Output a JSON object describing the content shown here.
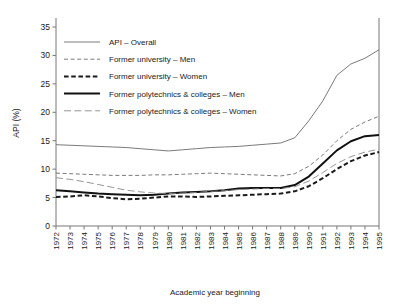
{
  "chart_data": {
    "type": "line",
    "title": "",
    "xlabel": "Academic year beginning",
    "ylabel": "API (%)",
    "xlim": [
      1972,
      1995
    ],
    "ylim": [
      0,
      35
    ],
    "ytick_values": [
      0,
      5,
      10,
      15,
      20,
      25,
      30,
      35
    ],
    "grid": false,
    "legend_position": "top-left-inside",
    "x": [
      1972,
      1973,
      1974,
      1975,
      1976,
      1977,
      1978,
      1979,
      1980,
      1981,
      1982,
      1983,
      1984,
      1985,
      1986,
      1987,
      1988,
      1989,
      1990,
      1991,
      1992,
      1993,
      1994,
      1995
    ],
    "series": [
      {
        "name": "API – Overall",
        "style": "solid-thin",
        "color": "#6b6b6b",
        "values": [
          14.3,
          14.2,
          14.1,
          14.0,
          13.9,
          13.8,
          13.6,
          13.4,
          13.2,
          13.4,
          13.6,
          13.8,
          13.9,
          14.0,
          14.2,
          14.4,
          14.6,
          15.5,
          18.5,
          22.0,
          26.5,
          28.5,
          29.5,
          31.0
        ]
      },
      {
        "name": "Former university – Men",
        "style": "dashed-thin",
        "color": "#6b6b6b",
        "values": [
          9.3,
          9.2,
          9.1,
          9.0,
          8.9,
          8.9,
          8.9,
          9.0,
          9.0,
          9.1,
          9.2,
          9.3,
          9.2,
          9.1,
          9.0,
          8.9,
          8.8,
          9.2,
          10.5,
          12.5,
          15.0,
          17.0,
          18.3,
          19.3
        ]
      },
      {
        "name": "Former university – Women",
        "style": "dashed-bold",
        "color": "#1a1a1a",
        "values": [
          5.1,
          5.2,
          5.4,
          5.2,
          4.9,
          4.7,
          4.8,
          5.0,
          5.2,
          5.2,
          5.1,
          5.2,
          5.3,
          5.4,
          5.5,
          5.6,
          5.7,
          6.1,
          7.0,
          8.4,
          10.0,
          11.4,
          12.4,
          13.0
        ]
      },
      {
        "name": "Former polytechnics & colleges – Men",
        "style": "solid-bold",
        "color": "#111111",
        "values": [
          6.3,
          6.1,
          5.9,
          5.7,
          5.6,
          5.5,
          5.4,
          5.5,
          5.7,
          5.9,
          6.0,
          6.1,
          6.3,
          6.6,
          6.7,
          6.7,
          6.7,
          7.2,
          8.7,
          11.0,
          13.3,
          14.9,
          15.8,
          16.0
        ]
      },
      {
        "name": "Former polytechnics & colleges – Women",
        "style": "dashed-long",
        "color": "#8a8a8a",
        "values": [
          8.5,
          8.2,
          7.8,
          7.3,
          6.8,
          6.3,
          6.0,
          5.8,
          5.7,
          5.8,
          5.9,
          6.1,
          6.2,
          6.4,
          6.5,
          6.6,
          6.6,
          6.9,
          7.9,
          9.4,
          11.0,
          12.2,
          13.0,
          13.5
        ]
      }
    ]
  }
}
